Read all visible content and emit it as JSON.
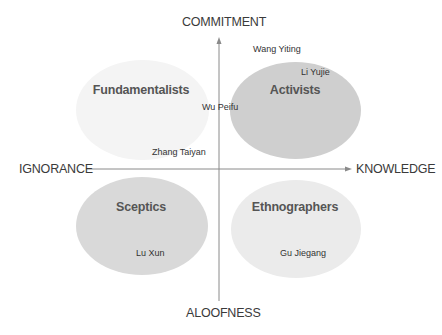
{
  "axes": {
    "top": "COMMITMENT",
    "bottom": "ALOOFNESS",
    "left": "IGNORANCE",
    "right": "KNOWLEDGE"
  },
  "quadrants": [
    {
      "label": "Fundamentalists",
      "position": "top-left",
      "fill": "#f3f3f3"
    },
    {
      "label": "Activists",
      "position": "top-right",
      "fill": "#cfcfcf"
    },
    {
      "label": "Sceptics",
      "position": "bottom-left",
      "fill": "#dadada"
    },
    {
      "label": "Ethnographers",
      "position": "bottom-right",
      "fill": "#ebebeb"
    }
  ],
  "people": [
    {
      "name": "Wang Yiting"
    },
    {
      "name": "Li Yujie"
    },
    {
      "name": "Wu Peifu"
    },
    {
      "name": "Zhang Taiyan"
    },
    {
      "name": "Lu Xun"
    },
    {
      "name": "Gu Jiegang"
    }
  ],
  "colors": {
    "axis": "#888888",
    "text": "#333333"
  }
}
